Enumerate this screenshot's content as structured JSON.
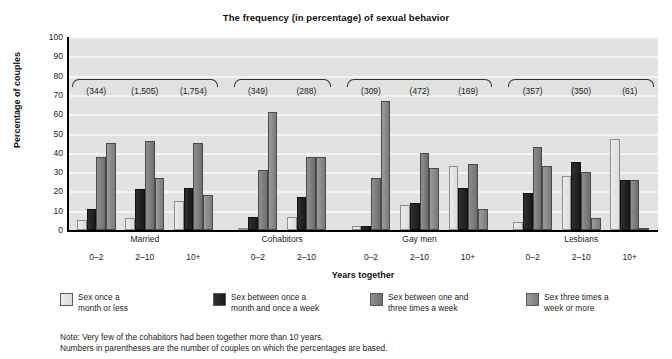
{
  "chart_data": {
    "type": "bar",
    "title": "The frequency (in percentage) of sexual behavior",
    "xlabel": "Years together",
    "ylabel": "Percentage of couples",
    "ylim": [
      0,
      100
    ],
    "yticks": [
      0,
      10,
      20,
      30,
      40,
      50,
      60,
      70,
      80,
      90,
      100
    ],
    "grid": true,
    "legend_position": "bottom",
    "series": [
      {
        "name": "Sex once a\nmonth or less",
        "color": "#e6e6e6",
        "values": [
          5,
          6,
          15,
          1,
          7,
          2,
          13,
          33,
          4,
          28,
          47
        ]
      },
      {
        "name": "Sex between once a\nmonth and once a week",
        "color": "#1f1f1f",
        "values": [
          11,
          21,
          22,
          7,
          17,
          2,
          14,
          22,
          19,
          35,
          26
        ]
      },
      {
        "name": "Sex between one and\nthree times a week",
        "color": "#7d7d7d",
        "values": [
          38,
          46,
          45,
          31,
          38,
          27,
          40,
          34,
          43,
          30,
          26
        ]
      },
      {
        "name": "Sex three times a\nweek or more",
        "color": "#8a8a8a",
        "values": [
          45,
          27,
          18,
          61,
          38,
          67,
          32,
          11,
          33,
          6,
          1
        ]
      }
    ],
    "categories": [
      "0–2",
      "2–10",
      "10+",
      "0–2",
      "2–10",
      "0–2",
      "2–10",
      "10+",
      "0–2",
      "2–10",
      "10+"
    ],
    "sample_sizes": [
      "(344)",
      "(1,505)",
      "(1,754)",
      "(349)",
      "(288)",
      "(309)",
      "(472)",
      "(169)",
      "(357)",
      "(350)",
      "(61)"
    ],
    "groups": [
      {
        "label": "Married",
        "start": 0,
        "count": 3
      },
      {
        "label": "Cohabitors",
        "start": 3,
        "count": 2
      },
      {
        "label": "Gay men",
        "start": 5,
        "count": 3
      },
      {
        "label": "Lesbians",
        "start": 8,
        "count": 3
      }
    ]
  },
  "footnote": {
    "line1": "Note: Very few of the cohabitors had been together more than 10 years.",
    "line2": "Numbers in parentheses are the number of couples on which the percentages are based."
  }
}
